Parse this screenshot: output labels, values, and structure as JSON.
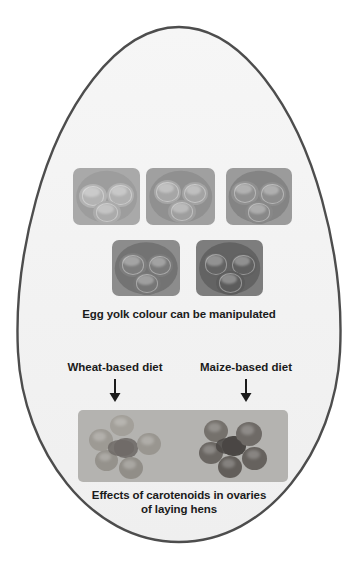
{
  "figure": {
    "shape": "egg-outline",
    "outline_color": "#4d4d4d",
    "fill_color": "#f4f4f4",
    "background_color": "#ffffff"
  },
  "yolk_row_top": {
    "panel_background": "#a6a6a6",
    "panels": [
      {
        "id": "yolk-panel-1",
        "label": "yolk-sample-1",
        "yolk_color": "#b0b0b0",
        "plate_color": "#9d9d9d"
      },
      {
        "id": "yolk-panel-2",
        "label": "yolk-sample-2",
        "yolk_color": "#a2a2a2",
        "plate_color": "#8f8f8f"
      },
      {
        "id": "yolk-panel-3",
        "label": "yolk-sample-3",
        "yolk_color": "#8e8e8e",
        "plate_color": "#7e7e7e"
      }
    ]
  },
  "yolk_row_bottom": {
    "panels": [
      {
        "id": "yolk-panel-4",
        "label": "yolk-sample-4",
        "yolk_color": "#7b7b7b",
        "plate_color": "#6f6f6f"
      },
      {
        "id": "yolk-panel-5",
        "label": "yolk-sample-5",
        "yolk_color": "#616161",
        "plate_color": "#595959"
      }
    ]
  },
  "captions": {
    "yolk_caption": "Egg yolk colour can be manipulated",
    "ovary_caption_line1": "Effects of carotenoids in ovaries",
    "ovary_caption_line2": "of laying hens"
  },
  "diet_labels": {
    "left": "Wheat-based diet",
    "right": "Maize-based diet"
  },
  "arrows": {
    "left_arrow": "arrow-down-icon",
    "right_arrow": "arrow-down-icon"
  },
  "ovary_panel": {
    "background_color": "#b3b3b3",
    "left_cluster": {
      "label": "ovary-wheat-diet",
      "follicle_color": "#9a9a9a"
    },
    "right_cluster": {
      "label": "ovary-maize-diet",
      "follicle_color": "#6b6b6b"
    }
  }
}
